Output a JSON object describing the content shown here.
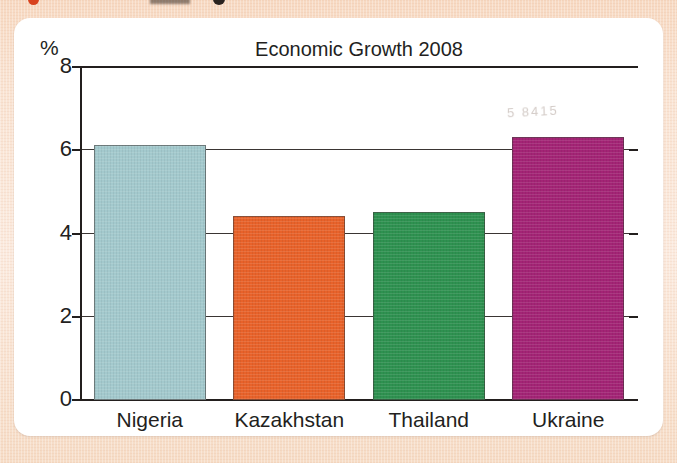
{
  "chart_data": {
    "type": "bar",
    "title": "Economic Growth 2008",
    "xlabel": "",
    "ylabel": "%",
    "categories": [
      "Nigeria",
      "Kazakhstan",
      "Thailand",
      "Ukraine"
    ],
    "values": [
      6.1,
      4.4,
      4.5,
      6.3
    ],
    "series": [
      {
        "name": "Economic Growth 2008",
        "values": [
          6.1,
          4.4,
          4.5,
          6.3
        ]
      }
    ],
    "bar_colors": [
      "#a3c9cd",
      "#e8622a",
      "#2e9150",
      "#a32475"
    ],
    "ylim": [
      0,
      8
    ],
    "y_ticks": [
      "0",
      "2",
      "4",
      "6",
      "8"
    ],
    "y_tick_values": [
      0,
      2,
      4,
      6,
      8
    ],
    "grid": true,
    "grid_axis": "y",
    "legend": false,
    "legend_position": "none"
  },
  "figure": {
    "background_color": "#ffffff",
    "page_color": "#f7dcc6",
    "axis_color": "#231f1e",
    "watermark_text": "5 8415"
  }
}
